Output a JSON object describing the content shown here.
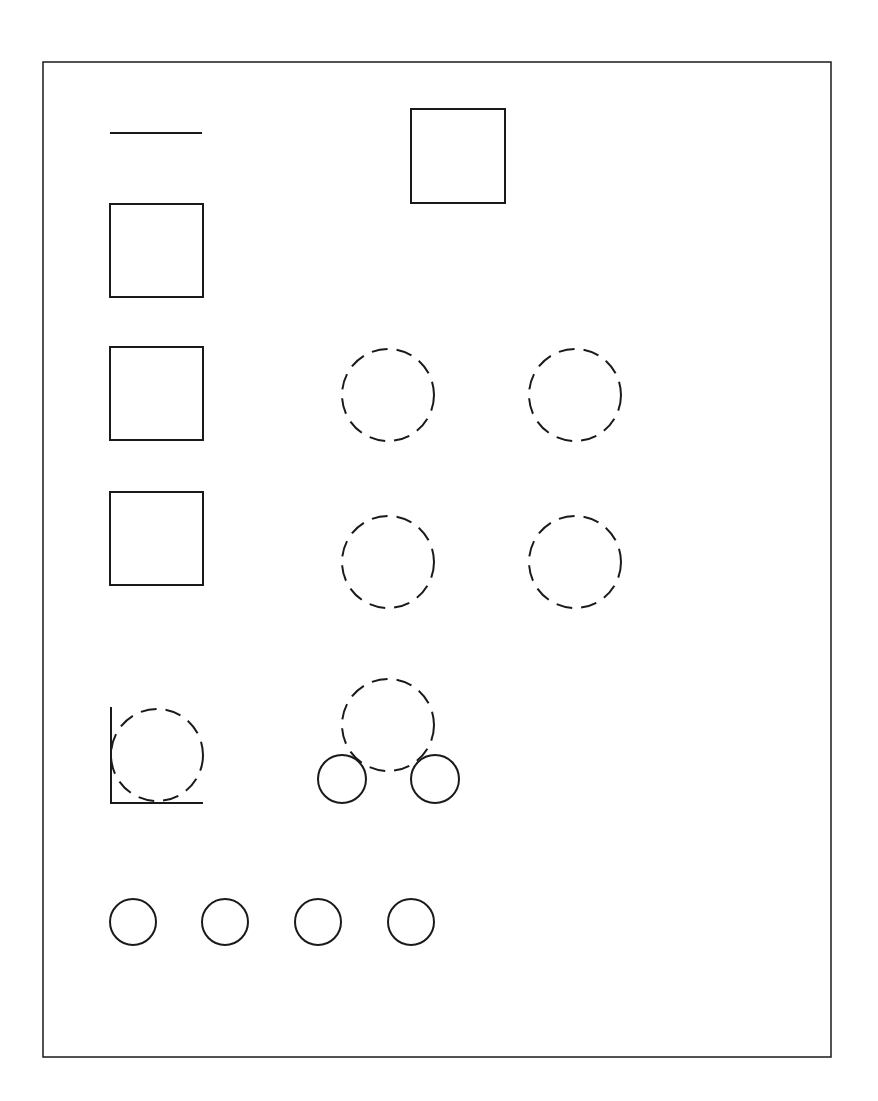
{
  "canvas": {
    "width": 878,
    "height": 1101,
    "background": "#ffffff",
    "stroke": "#1a1a1a"
  },
  "frame": {
    "x": 43,
    "y": 62,
    "width": 788,
    "height": 995
  },
  "line": {
    "x1": 110,
    "y1": 133,
    "x2": 202,
    "y2": 133
  },
  "squares": [
    {
      "x": 411,
      "y": 109,
      "size": 94
    },
    {
      "x": 110,
      "y": 204,
      "size": 93
    },
    {
      "x": 110,
      "y": 347,
      "size": 93
    },
    {
      "x": 110,
      "y": 492,
      "size": 93
    }
  ],
  "dashed_circles": [
    {
      "cx": 388,
      "cy": 395,
      "r": 46
    },
    {
      "cx": 575,
      "cy": 395,
      "r": 46
    },
    {
      "cx": 388,
      "cy": 562,
      "r": 46
    },
    {
      "cx": 575,
      "cy": 562,
      "r": 46
    },
    {
      "cx": 157,
      "cy": 755,
      "r": 46
    },
    {
      "cx": 388,
      "cy": 725,
      "r": 46
    }
  ],
  "corner": {
    "x": 111,
    "ytop": 707,
    "ybottom": 803,
    "xright": 203
  },
  "solid_circles": [
    {
      "cx": 342,
      "cy": 779,
      "r": 24
    },
    {
      "cx": 435,
      "cy": 779,
      "r": 24
    },
    {
      "cx": 133,
      "cy": 922,
      "r": 23
    },
    {
      "cx": 225,
      "cy": 922,
      "r": 23
    },
    {
      "cx": 318,
      "cy": 922,
      "r": 23
    },
    {
      "cx": 411,
      "cy": 922,
      "r": 23
    }
  ]
}
